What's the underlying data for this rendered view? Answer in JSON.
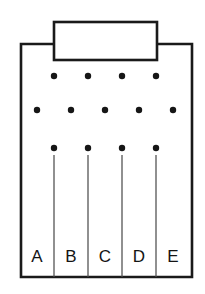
{
  "figure": {
    "background_color": "#ffffff",
    "line_color": "#1a1a1a",
    "divider_color": "#4d4d4d",
    "dot_color": "#161616",
    "body": {
      "name": "tray-body",
      "left": 21,
      "right": 192,
      "top": 44,
      "bottom": 277
    },
    "tab": {
      "name": "tray-tab",
      "left": 54,
      "right": 157,
      "top": 22,
      "bottom": 60
    },
    "dot_rows": [
      {
        "name": "dot-row-top",
        "y": 76,
        "count": 4,
        "x_positions": [
          54,
          88,
          122,
          156
        ],
        "radius": 3.2
      },
      {
        "name": "dot-row-middle",
        "y": 110,
        "count": 5,
        "x_positions": [
          37,
          71,
          105,
          139,
          173
        ],
        "radius": 3.2
      },
      {
        "name": "dot-row-bottom",
        "y": 148,
        "count": 4,
        "x_positions": [
          54,
          88,
          122,
          156
        ],
        "radius": 3.2
      }
    ],
    "dividers": {
      "name": "compartment-dividers",
      "count": 4,
      "x_positions": [
        54,
        88,
        122,
        156
      ],
      "y_top": 155,
      "y_bottom": 277
    },
    "compartments": [
      {
        "label": "A",
        "center_x": 37,
        "label_y": 262
      },
      {
        "label": "B",
        "center_x": 71,
        "label_y": 262
      },
      {
        "label": "C",
        "center_x": 105,
        "label_y": 262
      },
      {
        "label": "D",
        "center_x": 139,
        "label_y": 262
      },
      {
        "label": "E",
        "center_x": 173,
        "label_y": 262
      }
    ]
  }
}
